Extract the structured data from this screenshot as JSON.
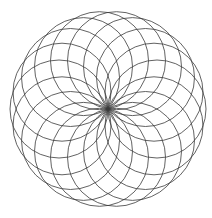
{
  "figure": {
    "background_color": "#ffffff",
    "stroke_color": "#3a3a3a",
    "stroke_width": 0.8,
    "canvas_width": 212,
    "canvas_height": 218
  },
  "chart_data": {
    "type": "scatter",
    "subtitle": "",
    "xlabel": "",
    "ylabel": "",
    "grid": false,
    "legend": false,
    "xlim": [
      0,
      212
    ],
    "ylim": [
      0,
      218
    ],
    "pattern": {
      "name": "rosette",
      "circle_count": 18,
      "angular_step_degrees": 20,
      "common_point": {
        "x": 108,
        "y": 109
      },
      "circle_radius": 49,
      "centers_ring_radius": 49,
      "outer_extent_radius": 98,
      "bounding_box": {
        "left": 13,
        "top": 11,
        "right": 201,
        "bottom": 207
      }
    },
    "circles": [
      {
        "index": 1,
        "angle_deg": 0,
        "cx": 157.0,
        "cy": 109.0,
        "r": 49
      },
      {
        "index": 2,
        "angle_deg": 20,
        "cx": 154.0,
        "cy": 92.2,
        "r": 49
      },
      {
        "index": 3,
        "angle_deg": 40,
        "cx": 145.5,
        "cy": 77.5,
        "r": 49
      },
      {
        "index": 4,
        "angle_deg": 60,
        "cx": 132.5,
        "cy": 66.6,
        "r": 49
      },
      {
        "index": 5,
        "angle_deg": 80,
        "cx": 116.5,
        "cy": 60.7,
        "r": 49
      },
      {
        "index": 6,
        "angle_deg": 100,
        "cx": 99.5,
        "cy": 60.7,
        "r": 49
      },
      {
        "index": 7,
        "angle_deg": 120,
        "cx": 83.5,
        "cy": 66.6,
        "r": 49
      },
      {
        "index": 8,
        "angle_deg": 140,
        "cx": 70.5,
        "cy": 77.5,
        "r": 49
      },
      {
        "index": 9,
        "angle_deg": 160,
        "cx": 62.0,
        "cy": 92.2,
        "r": 49
      },
      {
        "index": 10,
        "angle_deg": 180,
        "cx": 59.0,
        "cy": 109.0,
        "r": 49
      },
      {
        "index": 11,
        "angle_deg": 200,
        "cx": 62.0,
        "cy": 125.8,
        "r": 49
      },
      {
        "index": 12,
        "angle_deg": 220,
        "cx": 70.5,
        "cy": 140.5,
        "r": 49
      },
      {
        "index": 13,
        "angle_deg": 240,
        "cx": 83.5,
        "cy": 151.4,
        "r": 49
      },
      {
        "index": 14,
        "angle_deg": 260,
        "cx": 99.5,
        "cy": 157.3,
        "r": 49
      },
      {
        "index": 15,
        "angle_deg": 280,
        "cx": 116.5,
        "cy": 157.3,
        "r": 49
      },
      {
        "index": 16,
        "angle_deg": 300,
        "cx": 132.5,
        "cy": 151.4,
        "r": 49
      },
      {
        "index": 17,
        "angle_deg": 320,
        "cx": 145.5,
        "cy": 140.5,
        "r": 49
      },
      {
        "index": 18,
        "angle_deg": 340,
        "cx": 154.0,
        "cy": 125.8,
        "r": 49
      }
    ]
  }
}
